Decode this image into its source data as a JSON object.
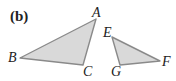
{
  "figure": {
    "panel_label": "(b)",
    "fill_color": "#d9d9d9",
    "stroke_color": "#8a8a8a",
    "triangles": [
      {
        "name": "ABC",
        "vertices": [
          {
            "label": "A",
            "x": 96,
            "y": 19
          },
          {
            "label": "B",
            "x": 20,
            "y": 58
          },
          {
            "label": "C",
            "x": 83,
            "y": 65
          }
        ]
      },
      {
        "name": "EFG",
        "vertices": [
          {
            "label": "E",
            "x": 112,
            "y": 37
          },
          {
            "label": "F",
            "x": 160,
            "y": 61
          },
          {
            "label": "G",
            "x": 120,
            "y": 65
          }
        ]
      }
    ]
  }
}
